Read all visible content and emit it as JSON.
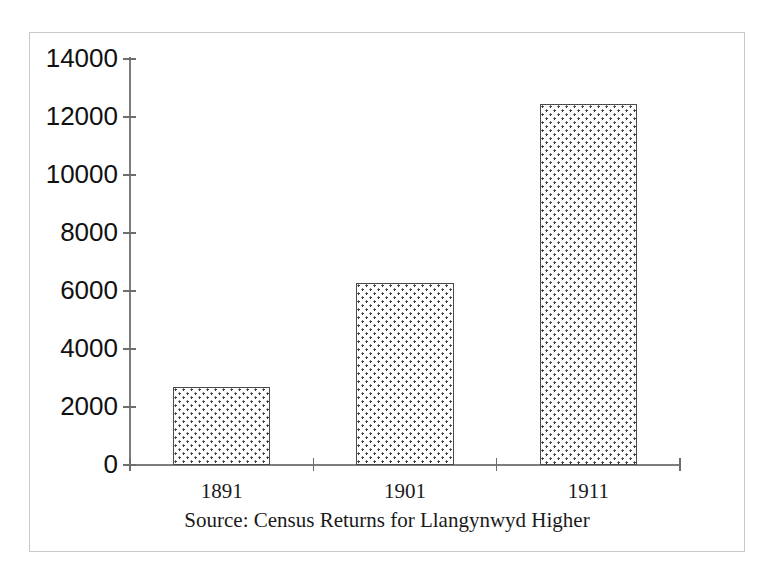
{
  "chart_data": {
    "type": "bar",
    "title": "",
    "subtitle": "",
    "caption": "Source: Census Returns for Llangynwyd Higher",
    "categories": [
      "1891",
      "1901",
      "1911"
    ],
    "values": [
      2700,
      6280,
      12450
    ],
    "series": [
      {
        "name": "Population",
        "values": [
          2700,
          6280,
          12450
        ]
      }
    ],
    "xlabel": "",
    "ylabel": "",
    "ylim": [
      0,
      14000
    ],
    "xlim": [
      0,
      3
    ],
    "y_ticks": [
      0,
      2000,
      4000,
      6000,
      8000,
      10000,
      12000,
      14000
    ],
    "y_tick_labels": [
      "0",
      "2000",
      "4000",
      "6000",
      "8000",
      "10000",
      "12000",
      "14000"
    ],
    "x_tick_labels": [
      "1891",
      "1901",
      "1911"
    ],
    "grid": false,
    "legend": false,
    "legend_position": "none",
    "bar_fill": "dotted-stipple",
    "bar_edge_color": "#4a4a4a",
    "axis_color": "#7d7d7d",
    "frame_color": "#c9c9c9",
    "background_color": "#ffffff",
    "text_color": "#111111"
  }
}
